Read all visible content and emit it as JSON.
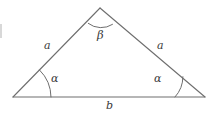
{
  "figure": {
    "type": "geometry-diagram",
    "shape": "isosceles-triangle",
    "background_color": "#ffffff",
    "stroke_color": "#6e6e6e",
    "label_color": "#3a3a3a",
    "vertices": {
      "apex": {
        "x": 100,
        "y": 8
      },
      "bottom_left": {
        "x": 13,
        "y": 97
      },
      "bottom_right": {
        "x": 205,
        "y": 97
      }
    },
    "labels": {
      "side_left": "a",
      "side_right": "a",
      "side_base": "b",
      "angle_apex": "β",
      "angle_bottom_left": "α",
      "angle_bottom_right": "α"
    },
    "angle_arcs": {
      "apex_radius": 21,
      "bottom_left_radius": 38,
      "bottom_right_radius": 30
    }
  }
}
